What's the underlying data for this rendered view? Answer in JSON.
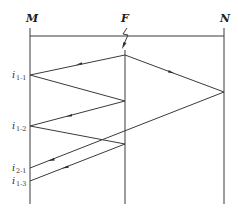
{
  "buses": [
    {
      "label": "M"
    },
    {
      "label": "F"
    },
    {
      "label": "N"
    }
  ],
  "current_labels": [
    {
      "main": "i",
      "sub": "1-1"
    },
    {
      "main": "i",
      "sub": "1-2"
    },
    {
      "main": "i",
      "sub": "2-1"
    },
    {
      "main": "i",
      "sub": "1-3"
    }
  ],
  "colors": {
    "line": "#3a3a3a",
    "text": "#222222",
    "background": "#ffffff"
  }
}
